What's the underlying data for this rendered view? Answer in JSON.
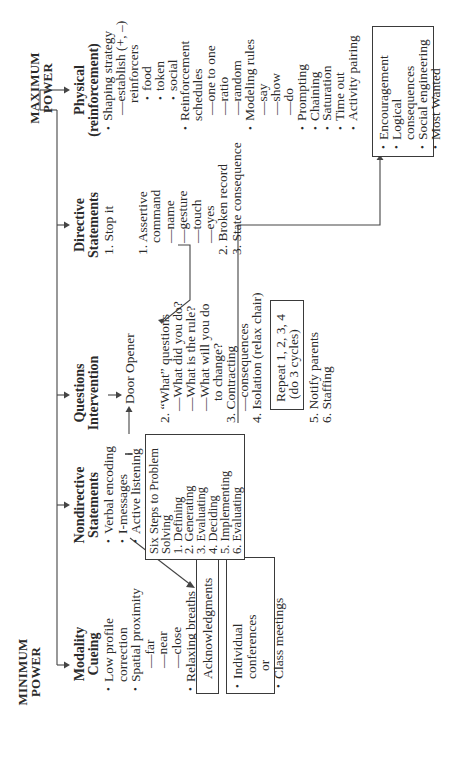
{
  "power": {
    "min": [
      "MINIMUM",
      "POWER"
    ],
    "max": [
      "MAXIMUM",
      "POWER"
    ]
  },
  "columns": {
    "modality": {
      "title": [
        "Modality",
        "Cueing"
      ],
      "items": [
        {
          "text": "Low profile",
          "bullet": true
        },
        {
          "text": "correction",
          "bullet": false
        },
        {
          "text": "Spatial proximity",
          "bullet": true
        },
        {
          "text": "—far",
          "bullet": false
        },
        {
          "text": "—near",
          "bullet": false
        },
        {
          "text": "—close",
          "bullet": false
        },
        {
          "text": "Relaxing breaths",
          "bullet": true
        }
      ]
    },
    "nondirective": {
      "title": [
        "Nondirective",
        "Statements"
      ],
      "items": [
        {
          "text": "Verbal encoding",
          "bullet": true
        },
        {
          "text": "I-messages",
          "bullet": true
        },
        {
          "text": "Active listening",
          "bullet": true
        },
        {
          "text": "Conferencing",
          "bullet": true
        }
      ]
    },
    "questions": {
      "title": [
        "Questions",
        "Intervention"
      ],
      "door_opener": "Door Opener",
      "items": [
        "2. “What” questions",
        "—What did you do?",
        "—What is the rule?",
        "—What will you do",
        "to change?",
        "3. Contracting",
        "—consequences",
        "4. Isolation (relax chair)"
      ],
      "repeat_box": [
        "Repeat 1, 2, 3, 4",
        "(do 3 cycles)"
      ],
      "after_items": [
        "5. Notify parents",
        "6. Staffing"
      ]
    },
    "directive": {
      "title": [
        "Directive",
        "Statements"
      ],
      "stop_it": "1. Stop it",
      "items": [
        "1. Assertive",
        "command",
        "—name",
        "—gesture",
        "—touch",
        "—eyes",
        "2. Broken record",
        "3. State consequence"
      ]
    },
    "physical": {
      "title": [
        "Physical",
        "(reinforcement)"
      ],
      "items": [
        {
          "text": "Shaping strategy",
          "bullet": true,
          "indent": 0
        },
        {
          "text": "—establish (+, –)",
          "bullet": false,
          "indent": 1
        },
        {
          "text": "reinforcers",
          "bullet": false,
          "indent": 2
        },
        {
          "text": "food",
          "bullet": true,
          "indent": 3
        },
        {
          "text": "token",
          "bullet": true,
          "indent": 3
        },
        {
          "text": "social",
          "bullet": true,
          "indent": 3
        },
        {
          "text": "Reinforcement",
          "bullet": true,
          "indent": 0
        },
        {
          "text": "schedules",
          "bullet": false,
          "indent": 1
        },
        {
          "text": "—one to one",
          "bullet": false,
          "indent": 1
        },
        {
          "text": "—ratio",
          "bullet": false,
          "indent": 1
        },
        {
          "text": "—random",
          "bullet": false,
          "indent": 1
        },
        {
          "text": "Modeling rules",
          "bullet": true,
          "indent": 0
        },
        {
          "text": "—say",
          "bullet": false,
          "indent": 1
        },
        {
          "text": "—show",
          "bullet": false,
          "indent": 1
        },
        {
          "text": "—do",
          "bullet": false,
          "indent": 1
        },
        {
          "text": "Prompting",
          "bullet": true,
          "indent": 0
        },
        {
          "text": "Chaining",
          "bullet": true,
          "indent": 0
        },
        {
          "text": "Saturation",
          "bullet": true,
          "indent": 0
        },
        {
          "text": "Time out",
          "bullet": true,
          "indent": 0
        },
        {
          "text": "Activity pairing",
          "bullet": true,
          "indent": 0
        }
      ]
    }
  },
  "boxes": {
    "acknowledgments": "Acknowledgments",
    "conferences": [
      "Individual conferences",
      "or",
      "Class meetings"
    ],
    "six_steps": [
      "Six Steps to Problem",
      "Solving",
      "1. Defining",
      "2. Generating",
      "3. Evaluating",
      "4. Deciding",
      "5. Implementing",
      "6. Evaluating"
    ],
    "encouragement": [
      "Encouragement",
      "Logical consequences",
      "Social engineering",
      "Most Wanted"
    ]
  },
  "colors": {
    "ink": "#2a2a2a",
    "line": "#444444",
    "background": "#ffffff"
  }
}
